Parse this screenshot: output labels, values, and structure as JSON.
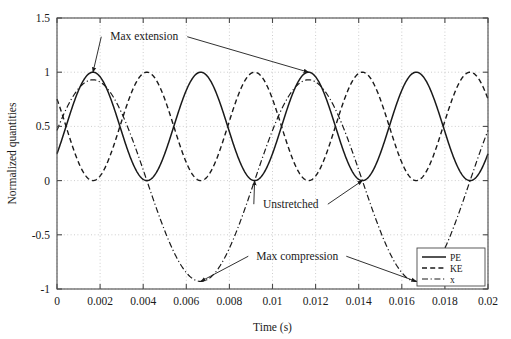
{
  "figure": {
    "name": "spring-mass-energy-plot",
    "background": "#ffffff",
    "ink_color": "#1a1a1a",
    "grid_color": "#b8b8b8"
  },
  "chart_data": {
    "type": "line",
    "title": "",
    "xlabel": "Time (s)",
    "ylabel": "Normalized quantities",
    "xlim": [
      0,
      0.02
    ],
    "ylim": [
      -1,
      1.5
    ],
    "xticks": [
      0,
      0.002,
      0.004,
      0.006,
      0.008,
      0.01,
      0.012,
      0.014,
      0.016,
      0.018,
      0.02
    ],
    "xticklabels": [
      "0",
      "0.002",
      "0.004",
      "0.006",
      "0.008",
      "0.01",
      "0.012",
      "0.014",
      "0.016",
      "0.018",
      "0.02"
    ],
    "yticks": [
      -1,
      -0.5,
      0,
      0.5,
      1,
      1.5
    ],
    "yticklabels": [
      "-1",
      "-0.5",
      "0",
      "0.5",
      "1",
      "1.5"
    ],
    "grid": true,
    "legend_position": "lower right",
    "series": [
      {
        "name": "PE",
        "style": "solid",
        "description": "Potential energy, PE = x^2, period 0.005 s, range 0 to 1",
        "amplitude": 0.5,
        "offset": 0.5,
        "period": 0.005,
        "phase_peak_t": 0.00167,
        "x": [
          0,
          0.00042,
          0.00083,
          0.00125,
          0.00167,
          0.00208,
          0.0025,
          0.00292,
          0.00333,
          0.00375,
          0.00417,
          0.00458,
          0.005,
          0.00542,
          0.00583,
          0.00625,
          0.00667,
          0.00708,
          0.0075,
          0.00792,
          0.00833,
          0.00875,
          0.00917,
          0.00958,
          0.01,
          0.01042,
          0.01083,
          0.01125,
          0.01167,
          0.01208,
          0.0125,
          0.01292,
          0.01333,
          0.01375,
          0.01417,
          0.01458,
          0.015,
          0.01542,
          0.01583,
          0.01625,
          0.01667,
          0.01708,
          0.0175,
          0.01792,
          0.01833,
          0.01875,
          0.01917,
          0.01958,
          0.02
        ],
        "y": [
          0.29,
          0.5,
          0.71,
          0.9,
          1.0,
          0.9,
          0.71,
          0.5,
          0.29,
          0.1,
          0.0,
          0.1,
          0.29,
          0.5,
          0.71,
          0.9,
          1.0,
          0.9,
          0.71,
          0.5,
          0.29,
          0.1,
          0.0,
          0.1,
          0.29,
          0.5,
          0.71,
          0.9,
          1.0,
          0.9,
          0.71,
          0.5,
          0.29,
          0.1,
          0.0,
          0.1,
          0.29,
          0.5,
          0.71,
          0.9,
          1.0,
          0.9,
          0.71,
          0.5,
          0.29,
          0.1,
          0.0,
          0.1,
          0.29
        ]
      },
      {
        "name": "KE",
        "style": "dashed",
        "description": "Kinetic energy, KE = 1 - x^2, period 0.005 s, range 0 to 1",
        "amplitude": 0.5,
        "offset": 0.5,
        "period": 0.005,
        "phase_peak_t": 0.00417,
        "x": [
          0,
          0.00042,
          0.00083,
          0.00125,
          0.00167,
          0.00208,
          0.0025,
          0.00292,
          0.00333,
          0.00375,
          0.00417,
          0.00458,
          0.005,
          0.00542,
          0.00583,
          0.00625,
          0.00667,
          0.00708,
          0.0075,
          0.00792,
          0.00833,
          0.00875,
          0.00917,
          0.00958,
          0.01,
          0.01042,
          0.01083,
          0.01125,
          0.01167,
          0.01208,
          0.0125,
          0.01292,
          0.01333,
          0.01375,
          0.01417,
          0.01458,
          0.015,
          0.01542,
          0.01583,
          0.01625,
          0.01667,
          0.01708,
          0.0175,
          0.01792,
          0.01833,
          0.01875,
          0.01917,
          0.01958,
          0.02
        ],
        "y": [
          0.71,
          0.5,
          0.29,
          0.1,
          0.0,
          0.1,
          0.29,
          0.5,
          0.71,
          0.9,
          1.0,
          0.9,
          0.71,
          0.5,
          0.29,
          0.1,
          0.0,
          0.1,
          0.29,
          0.5,
          0.71,
          0.9,
          1.0,
          0.9,
          0.71,
          0.5,
          0.29,
          0.1,
          0.0,
          0.1,
          0.29,
          0.5,
          0.71,
          0.9,
          1.0,
          0.9,
          0.71,
          0.5,
          0.29,
          0.1,
          0.0,
          0.1,
          0.29,
          0.5,
          0.71,
          0.9,
          1.0,
          0.9,
          0.71
        ]
      },
      {
        "name": "x",
        "style": "dash-dot",
        "description": "Displacement x, cosine, period 0.01 s, amplitude about 0.93",
        "amplitude": 0.93,
        "offset": 0,
        "period": 0.01,
        "phase_peak_t": 0.00167,
        "x": [
          0,
          0.00083,
          0.00167,
          0.0025,
          0.00333,
          0.00417,
          0.005,
          0.00583,
          0.00667,
          0.0075,
          0.00833,
          0.00917,
          0.01,
          0.01083,
          0.01167,
          0.0125,
          0.01333,
          0.01417,
          0.015,
          0.01583,
          0.01667,
          0.0175,
          0.01833,
          0.01917,
          0.02
        ],
        "y": [
          0.54,
          0.93,
          0.93,
          0.54,
          0.0,
          -0.54,
          -0.93,
          -0.93,
          -0.93,
          -0.54,
          0.0,
          0.54,
          0.8,
          0.93,
          0.93,
          0.54,
          0.0,
          -0.54,
          -0.86,
          -0.93,
          -0.93,
          -0.54,
          0.0,
          0.54,
          0.46
        ]
      }
    ],
    "annotations": [
      {
        "text": "Max extension",
        "text_x": 0.00405,
        "text_y": 1.295,
        "targets": [
          {
            "x": 0.00167,
            "y": 1.0
          },
          {
            "x": 0.01167,
            "y": 1.0
          }
        ]
      },
      {
        "text": "Unstretched",
        "text_x": 0.01085,
        "text_y": -0.25,
        "targets": [
          {
            "x": 0.00917,
            "y": 0.0
          },
          {
            "x": 0.01417,
            "y": 0.0
          }
        ]
      },
      {
        "text": "Max compression",
        "text_x": 0.01115,
        "text_y": -0.73,
        "targets": [
          {
            "x": 0.00667,
            "y": -0.93
          },
          {
            "x": 0.01667,
            "y": -0.93
          }
        ]
      }
    ]
  }
}
